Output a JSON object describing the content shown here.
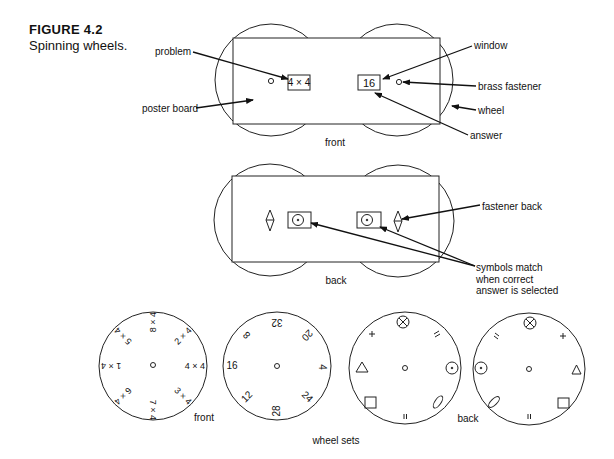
{
  "figure": {
    "number": "FIGURE 4.2",
    "title": "Spinning wheels."
  },
  "front_view": {
    "label": "front",
    "window_left_text": "4 × 4",
    "window_right_text": "16",
    "callouts": {
      "problem": "problem",
      "poster_board": "poster board",
      "window": "window",
      "brass_fastener": "brass fastener",
      "wheel": "wheel",
      "answer": "answer"
    }
  },
  "back_view": {
    "label": "back",
    "callouts": {
      "fastener_back": "fastener back",
      "symbols_match_line1": "symbols match",
      "symbols_match_line2": "when correct",
      "symbols_match_line3": "answer is selected"
    }
  },
  "wheel_sets": {
    "label": "wheel sets",
    "front_label": "front",
    "back_label": "back",
    "problem_wheel": [
      "4 × 4",
      "2 × 4",
      "8 × 4",
      "5 × 4",
      "1 × 4",
      "6 × 4",
      "7 × 4",
      "3 × 4"
    ],
    "answer_wheel": [
      "4",
      "20",
      "32",
      "8",
      "16",
      "12",
      "28",
      "24"
    ],
    "back_wheel_1_symbols": [
      "circle-dot",
      "double-slash",
      "circle-x",
      "plus",
      "triangle",
      "square",
      "double-bar",
      "ellipse"
    ],
    "back_wheel_2_symbols": [
      "triangle",
      "plus",
      "circle-x",
      "double-slash",
      "circle-dot",
      "ellipse",
      "double-bar",
      "square"
    ]
  }
}
